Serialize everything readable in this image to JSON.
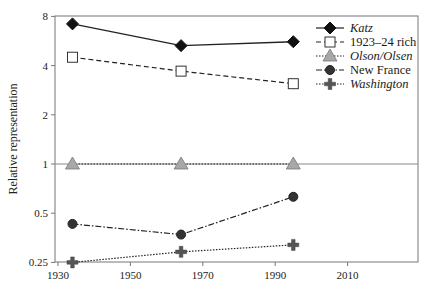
{
  "chart_data": {
    "type": "line",
    "title": "",
    "xlabel": "",
    "ylabel": "Relative representation",
    "yscale": "log2",
    "ylim": [
      0.25,
      8
    ],
    "xlim": [
      1930,
      2030
    ],
    "x_ticks": [
      "1930",
      "1950",
      "1970",
      "1990",
      "2010"
    ],
    "y_ticks": [
      "8",
      "4",
      "2",
      "1",
      "0.5",
      "0.25"
    ],
    "grid": false,
    "reference_line": 1,
    "legend_position": "upper right",
    "x": [
      1934,
      1964,
      1995
    ],
    "series": [
      {
        "name": "Katz",
        "italic": true,
        "marker": "diamond-filled",
        "line": "solid",
        "values": [
          7.2,
          5.3,
          5.6
        ]
      },
      {
        "name": "1923–24 rich",
        "italic": false,
        "marker": "square-open",
        "line": "dashed",
        "values": [
          4.5,
          3.7,
          3.1
        ]
      },
      {
        "name": "Olson/Olsen",
        "italic": true,
        "marker": "triangle-gray",
        "line": "dotted",
        "values": [
          1.0,
          1.0,
          1.0
        ]
      },
      {
        "name": "New France",
        "italic": false,
        "marker": "circle-filled",
        "line": "dash-dot",
        "values": [
          0.43,
          0.37,
          0.63
        ]
      },
      {
        "name": "Washington",
        "italic": true,
        "marker": "cross",
        "line": "dotted",
        "values": [
          0.25,
          0.29,
          0.32
        ]
      }
    ]
  }
}
